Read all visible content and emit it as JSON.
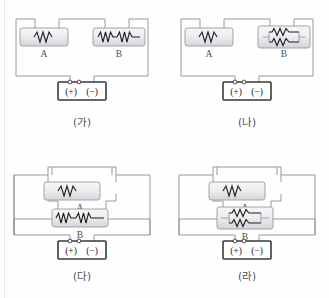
{
  "figure": {
    "title": "",
    "background_color": "#fefefe",
    "wire_color": "#8f8f95",
    "battery_border_color": "#3a3a3a",
    "resistor_box_fill_top": "#f4f4f6",
    "resistor_box_fill_bottom": "#d8d8dc",
    "resistor_box_border": "#9a9aa0",
    "zigzag_color": "#1d1d1f",
    "label_color": "#4e4e52",
    "edge_rule_color": "#e9e9ec"
  },
  "panels": [
    {
      "id": "ga",
      "caption": "(가)",
      "arrangement": "series",
      "boxes": [
        {
          "label": "A",
          "internal": "single-resistor",
          "resistor_count": 1
        },
        {
          "label": "B",
          "internal": "two-resistors-in-series",
          "resistor_count": 2
        }
      ],
      "battery": {
        "plus_label": "(+)",
        "minus_label": "(−)",
        "terminal_count": 2
      }
    },
    {
      "id": "na",
      "caption": "(나)",
      "arrangement": "series",
      "boxes": [
        {
          "label": "A",
          "internal": "single-resistor",
          "resistor_count": 1
        },
        {
          "label": "B",
          "internal": "two-resistors-in-parallel",
          "resistor_count": 2
        }
      ],
      "battery": {
        "plus_label": "(+)",
        "minus_label": "(−)",
        "terminal_count": 2
      }
    },
    {
      "id": "da",
      "caption": "(다)",
      "arrangement": "parallel",
      "boxes": [
        {
          "label": "A",
          "internal": "single-resistor",
          "resistor_count": 1
        },
        {
          "label": "B",
          "internal": "two-resistors-in-series",
          "resistor_count": 2
        }
      ],
      "battery": {
        "plus_label": "(+)",
        "minus_label": "(−)",
        "terminal_count": 2
      }
    },
    {
      "id": "ra",
      "caption": "(라)",
      "arrangement": "parallel",
      "boxes": [
        {
          "label": "A",
          "internal": "single-resistor",
          "resistor_count": 1
        },
        {
          "label": "B",
          "internal": "two-resistors-in-parallel",
          "resistor_count": 2
        }
      ],
      "battery": {
        "plus_label": "(+)",
        "minus_label": "(−)",
        "terminal_count": 2
      }
    }
  ]
}
